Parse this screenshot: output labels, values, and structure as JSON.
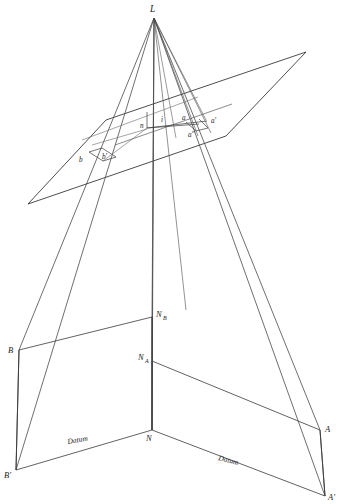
{
  "figure": {
    "line_color": "#3a3a3a",
    "ray_color": "#4a4a4a",
    "text_color": "#1a1a1a",
    "background": "#ffffff"
  },
  "labels": {
    "station": "L",
    "image_a": "a",
    "image_a_prime": "a'",
    "image_a_dprime": "a″",
    "image_b": "b",
    "image_b_prime": "b'",
    "image_b_dprime": "b″",
    "nadir_image": "n",
    "isocenter": "i",
    "ground_a": "A",
    "ground_a_prime": "A'",
    "ground_b": "B",
    "ground_b_prime": "B'",
    "nadir_ground": "N",
    "nadir_a_base": "N",
    "nadir_a_sub": "A",
    "nadir_b_base": "N",
    "nadir_b_sub": "B",
    "datum_left": "Datum",
    "datum_right": "Datum"
  },
  "geometry": {
    "station_point": {
      "x": 154,
      "y": 18
    },
    "image_plane_corners": [
      {
        "x": 28,
        "y": 204
      },
      {
        "x": 106,
        "y": 120
      },
      {
        "x": 306,
        "y": 52
      },
      {
        "x": 226,
        "y": 136
      }
    ],
    "image_points": {
      "n": {
        "x": 147,
        "y": 128
      },
      "i": {
        "x": 163,
        "y": 125
      },
      "a": {
        "x": 186,
        "y": 122
      },
      "a_prime": {
        "x": 206,
        "y": 120
      },
      "a_dprime": {
        "x": 196,
        "y": 131
      },
      "b": {
        "x": 89,
        "y": 151
      },
      "b_prime": {
        "x": 112,
        "y": 148
      },
      "b_dprime": {
        "x": 103,
        "y": 160
      }
    },
    "ground_points": {
      "N": {
        "x": 152,
        "y": 430
      },
      "N_A": {
        "x": 152,
        "y": 361
      },
      "N_B": {
        "x": 152,
        "y": 317
      },
      "A": {
        "x": 320,
        "y": 430
      },
      "A_prime": {
        "x": 325,
        "y": 496
      },
      "B": {
        "x": 19,
        "y": 350
      },
      "B_prime": {
        "x": 16,
        "y": 470
      }
    },
    "vertical_axis": {
      "top_x": 154,
      "top_y": 18,
      "bottom_x": 152,
      "bottom_y": 430
    }
  }
}
